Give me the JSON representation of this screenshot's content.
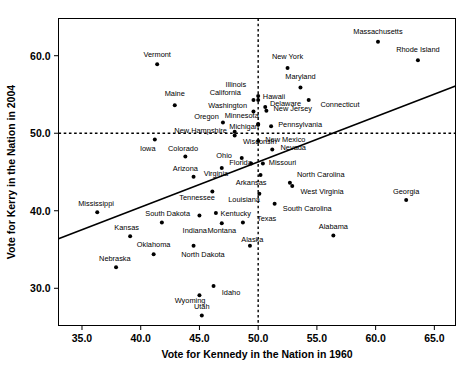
{
  "chart_data": {
    "type": "scatter",
    "title": "",
    "xlabel": "Vote for Kennedy in the Nation in 1960",
    "ylabel": "Vote for Kerry in the Nation in 2004",
    "xlim": [
      33.0,
      66.8
    ],
    "ylim": [
      25.2,
      64.8
    ],
    "xticks": [
      35.0,
      40.0,
      45.0,
      50.0,
      55.0,
      60.0,
      65.0
    ],
    "yticks": [
      30.0,
      40.0,
      50.0,
      60.0
    ],
    "xtick_labels": [
      "35.0",
      "40.0",
      "45.0",
      "50.0",
      "55.0",
      "60.0",
      "65.0"
    ],
    "ytick_labels": [
      "30.0",
      "40.0",
      "50.0",
      "60.0"
    ],
    "grid": false,
    "legend": "none",
    "reference_lines": [
      {
        "name": "vertical-50-reference",
        "orientation": "vertical",
        "value": 50.0,
        "style": "dashed"
      },
      {
        "name": "horizontal-50-reference",
        "orientation": "horizontal",
        "value": 50.0,
        "style": "dashed"
      }
    ],
    "fit_line": {
      "name": "regression-line",
      "style": "solid",
      "x_start": 33.0,
      "y_start": 36.4,
      "x_end": 66.8,
      "y_end": 56.1
    },
    "points": [
      {
        "label": "Vermont",
        "x": 41.4,
        "y": 58.9,
        "lx": 41.4,
        "ly": 60.2,
        "anchor": "middle"
      },
      {
        "label": "Massachusetts",
        "x": 60.2,
        "y": 61.8,
        "lx": 60.2,
        "ly": 63.2,
        "anchor": "middle"
      },
      {
        "label": "Rhode Island",
        "x": 63.6,
        "y": 59.4,
        "lx": 63.6,
        "ly": 60.8,
        "anchor": "middle"
      },
      {
        "label": "New York",
        "x": 52.5,
        "y": 58.4,
        "lx": 52.5,
        "ly": 59.9,
        "anchor": "middle"
      },
      {
        "label": "Maryland",
        "x": 53.6,
        "y": 55.9,
        "lx": 53.6,
        "ly": 57.3,
        "anchor": "middle"
      },
      {
        "label": "Illinois",
        "x": 50.0,
        "y": 54.8,
        "lx": 48.1,
        "ly": 56.3,
        "anchor": "middle"
      },
      {
        "label": "Hawaii",
        "x": 50.0,
        "y": 54.3,
        "lx": 50.4,
        "ly": 54.8,
        "anchor": "start"
      },
      {
        "label": "California",
        "x": 49.6,
        "y": 54.3,
        "lx": 47.2,
        "ly": 55.3,
        "anchor": "middle"
      },
      {
        "label": "Delaware",
        "x": 50.6,
        "y": 53.4,
        "lx": 51.0,
        "ly": 53.9,
        "anchor": "start"
      },
      {
        "label": "Connecticut",
        "x": 54.3,
        "y": 54.3,
        "lx": 55.3,
        "ly": 53.7,
        "anchor": "start"
      },
      {
        "label": "Maine",
        "x": 42.9,
        "y": 53.6,
        "lx": 42.9,
        "ly": 55.1,
        "anchor": "middle"
      },
      {
        "label": "Washington",
        "x": 49.6,
        "y": 52.8,
        "lx": 47.4,
        "ly": 53.6,
        "anchor": "middle"
      },
      {
        "label": "New Jersey",
        "x": 50.7,
        "y": 52.9,
        "lx": 51.3,
        "ly": 53.2,
        "anchor": "start"
      },
      {
        "label": "Minnesota",
        "x": 50.0,
        "y": 51.1,
        "lx": 48.6,
        "ly": 52.3,
        "anchor": "middle"
      },
      {
        "label": "Oregon",
        "x": 47.0,
        "y": 51.4,
        "lx": 45.6,
        "ly": 52.2,
        "anchor": "middle"
      },
      {
        "label": "Pennsylvania",
        "x": 51.1,
        "y": 50.9,
        "lx": 51.7,
        "ly": 51.1,
        "anchor": "start"
      },
      {
        "label": "Michigan",
        "x": 50.0,
        "y": 51.2,
        "lx": 48.8,
        "ly": 50.9,
        "anchor": "middle"
      },
      {
        "label": "New Hampshire",
        "x": 48.0,
        "y": 50.2,
        "lx": 45.1,
        "ly": 50.4,
        "anchor": "middle"
      },
      {
        "label": "New Mexico",
        "x": 50.0,
        "y": 49.0,
        "lx": 50.6,
        "ly": 49.2,
        "anchor": "start"
      },
      {
        "label": "Wisconsin",
        "x": 48.0,
        "y": 49.7,
        "lx": 48.7,
        "ly": 49.0,
        "anchor": "start"
      },
      {
        "label": "Iowa",
        "x": 41.2,
        "y": 49.2,
        "lx": 40.6,
        "ly": 48.1,
        "anchor": "middle"
      },
      {
        "label": "Nevada",
        "x": 51.2,
        "y": 47.9,
        "lx": 51.9,
        "ly": 48.2,
        "anchor": "start"
      },
      {
        "label": "Colorado",
        "x": 43.8,
        "y": 47.0,
        "lx": 43.6,
        "ly": 48.1,
        "anchor": "middle"
      },
      {
        "label": "Ohio",
        "x": 48.6,
        "y": 46.8,
        "lx": 47.1,
        "ly": 47.1,
        "anchor": "middle"
      },
      {
        "label": "Missouri",
        "x": 50.4,
        "y": 46.1,
        "lx": 50.9,
        "ly": 46.3,
        "anchor": "start"
      },
      {
        "label": "Florida",
        "x": 49.4,
        "y": 46.1,
        "lx": 48.5,
        "ly": 46.3,
        "anchor": "middle"
      },
      {
        "label": "Arizona",
        "x": 44.5,
        "y": 44.4,
        "lx": 43.8,
        "ly": 45.5,
        "anchor": "middle"
      },
      {
        "label": "Virginia",
        "x": 46.9,
        "y": 45.5,
        "lx": 46.4,
        "ly": 44.8,
        "anchor": "middle"
      },
      {
        "label": "North Carolina",
        "x": 52.7,
        "y": 43.6,
        "lx": 53.3,
        "ly": 44.7,
        "anchor": "start"
      },
      {
        "label": "Arkansas",
        "x": 50.2,
        "y": 44.6,
        "lx": 49.4,
        "ly": 43.6,
        "anchor": "middle"
      },
      {
        "label": "West Virginia",
        "x": 52.9,
        "y": 43.2,
        "lx": 53.6,
        "ly": 42.5,
        "anchor": "start"
      },
      {
        "label": "Tennessee",
        "x": 46.1,
        "y": 42.5,
        "lx": 44.8,
        "ly": 41.7,
        "anchor": "middle"
      },
      {
        "label": "Louisiana",
        "x": 50.1,
        "y": 42.2,
        "lx": 48.8,
        "ly": 41.5,
        "anchor": "middle"
      },
      {
        "label": "South Carolina",
        "x": 51.4,
        "y": 40.9,
        "lx": 52.1,
        "ly": 40.3,
        "anchor": "start"
      },
      {
        "label": "Georgia",
        "x": 62.6,
        "y": 41.4,
        "lx": 62.6,
        "ly": 42.5,
        "anchor": "middle"
      },
      {
        "label": "Mississippi",
        "x": 36.3,
        "y": 39.8,
        "lx": 36.2,
        "ly": 41.0,
        "anchor": "middle"
      },
      {
        "label": "South Dakota",
        "x": 45.0,
        "y": 39.4,
        "lx": 44.2,
        "ly": 39.6,
        "anchor": "end"
      },
      {
        "label": "Kentucky",
        "x": 46.4,
        "y": 39.7,
        "lx": 46.8,
        "ly": 39.6,
        "anchor": "start"
      },
      {
        "label": "Texas",
        "x": 48.7,
        "y": 38.5,
        "lx": 49.9,
        "ly": 39.0,
        "anchor": "start"
      },
      {
        "label": "Kansas",
        "x": 39.1,
        "y": 36.7,
        "lx": 38.8,
        "ly": 37.9,
        "anchor": "middle"
      },
      {
        "label": "Indiana",
        "x": 41.8,
        "y": 38.5,
        "lx": 44.6,
        "ly": 37.5,
        "anchor": "middle"
      },
      {
        "label": "Montana",
        "x": 46.9,
        "y": 38.4,
        "lx": 46.9,
        "ly": 37.5,
        "anchor": "middle"
      },
      {
        "label": "Alabama",
        "x": 56.4,
        "y": 36.8,
        "lx": 56.4,
        "ly": 38.0,
        "anchor": "middle"
      },
      {
        "label": "Alaska",
        "x": 49.3,
        "y": 35.5,
        "lx": 49.5,
        "ly": 36.3,
        "anchor": "middle"
      },
      {
        "label": "Oklahoma",
        "x": 41.1,
        "y": 34.4,
        "lx": 41.1,
        "ly": 35.6,
        "anchor": "middle"
      },
      {
        "label": "North Dakota",
        "x": 44.5,
        "y": 35.5,
        "lx": 45.3,
        "ly": 34.4,
        "anchor": "middle"
      },
      {
        "label": "Nebraska",
        "x": 37.9,
        "y": 32.7,
        "lx": 37.8,
        "ly": 33.9,
        "anchor": "middle"
      },
      {
        "label": "Idaho",
        "x": 46.2,
        "y": 30.3,
        "lx": 46.9,
        "ly": 29.5,
        "anchor": "start"
      },
      {
        "label": "Wyoming",
        "x": 45.0,
        "y": 29.1,
        "lx": 44.2,
        "ly": 28.4,
        "anchor": "middle"
      },
      {
        "label": "Utah",
        "x": 45.2,
        "y": 26.5,
        "lx": 45.2,
        "ly": 27.6,
        "anchor": "middle"
      }
    ]
  }
}
